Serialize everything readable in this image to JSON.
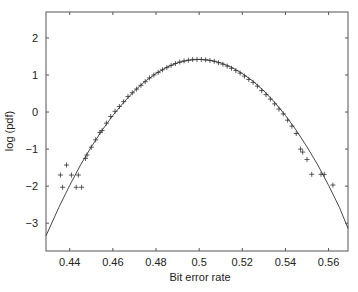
{
  "chart_data": {
    "type": "scatter",
    "title": "",
    "xlabel": "Bit error rate",
    "ylabel": "log (pdf)",
    "xlim": [
      0.429,
      0.569
    ],
    "ylim": [
      -3.75,
      2.7
    ],
    "grid": false,
    "legend": null,
    "xticks": [
      0.44,
      0.46,
      0.48,
      0.5,
      0.52,
      0.54,
      0.56
    ],
    "xtick_labels": [
      "0.44",
      "0.46",
      "0.48",
      "0.5",
      "0.52",
      "0.54",
      "0.56"
    ],
    "yticks": [
      2,
      1,
      0,
      -1,
      -2,
      -3
    ],
    "ytick_labels": [
      "2",
      "1",
      "0",
      "−1",
      "−2",
      "−3"
    ],
    "series": [
      {
        "name": "Gaussian fit",
        "kind": "line",
        "color": "#333333",
        "x": [
          0.429,
          0.435,
          0.44,
          0.445,
          0.45,
          0.455,
          0.46,
          0.465,
          0.47,
          0.475,
          0.48,
          0.485,
          0.49,
          0.495,
          0.5,
          0.505,
          0.51,
          0.515,
          0.52,
          0.525,
          0.53,
          0.535,
          0.54,
          0.545,
          0.55,
          0.555,
          0.56,
          0.565,
          0.569
        ],
        "y": [
          -3.34,
          -2.57,
          -1.98,
          -1.43,
          -0.94,
          -0.49,
          -0.09,
          0.26,
          0.57,
          0.83,
          1.04,
          1.21,
          1.33,
          1.4,
          1.42,
          1.4,
          1.33,
          1.21,
          1.04,
          0.83,
          0.57,
          0.26,
          -0.09,
          -0.49,
          -0.94,
          -1.43,
          -1.98,
          -2.57,
          -3.14
        ]
      },
      {
        "name": "Measured",
        "kind": "marker",
        "marker": "+",
        "color": "#333333",
        "x": [
          0.4357,
          0.4367,
          0.4385,
          0.4408,
          0.443,
          0.444,
          0.4455,
          0.4473,
          0.448,
          0.45,
          0.452,
          0.454,
          0.455,
          0.457,
          0.459,
          0.461,
          0.463,
          0.465,
          0.467,
          0.469,
          0.471,
          0.473,
          0.475,
          0.477,
          0.479,
          0.481,
          0.483,
          0.485,
          0.487,
          0.489,
          0.491,
          0.493,
          0.495,
          0.497,
          0.499,
          0.501,
          0.503,
          0.505,
          0.507,
          0.509,
          0.511,
          0.513,
          0.515,
          0.517,
          0.519,
          0.521,
          0.523,
          0.525,
          0.527,
          0.529,
          0.531,
          0.533,
          0.535,
          0.537,
          0.539,
          0.541,
          0.543,
          0.545,
          0.547,
          0.548,
          0.55,
          0.5522,
          0.5565,
          0.558,
          0.562
        ],
        "y": [
          -1.7,
          -2.03,
          -1.43,
          -1.7,
          -2.03,
          -1.7,
          -2.03,
          -1.25,
          -1.16,
          -0.95,
          -0.75,
          -0.55,
          -0.5,
          -0.3,
          -0.12,
          0.02,
          0.15,
          0.28,
          0.42,
          0.52,
          0.62,
          0.72,
          0.82,
          0.92,
          1.0,
          1.07,
          1.14,
          1.2,
          1.26,
          1.31,
          1.35,
          1.38,
          1.4,
          1.42,
          1.42,
          1.42,
          1.41,
          1.39,
          1.37,
          1.33,
          1.29,
          1.24,
          1.18,
          1.12,
          1.05,
          0.97,
          0.88,
          0.8,
          0.7,
          0.58,
          0.47,
          0.35,
          0.22,
          0.08,
          -0.05,
          -0.22,
          -0.38,
          -0.58,
          -1.0,
          -1.08,
          -1.28,
          -1.68,
          -1.68,
          -1.68,
          -1.97
        ]
      }
    ]
  }
}
